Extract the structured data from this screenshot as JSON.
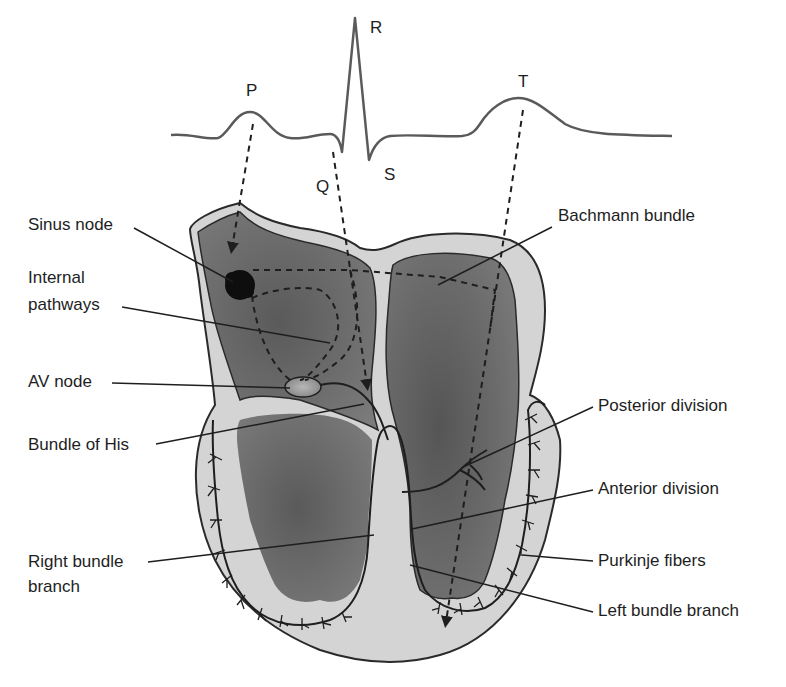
{
  "figure": {
    "ecg_waves": [
      {
        "id": "P",
        "label": "P"
      },
      {
        "id": "Q",
        "label": "Q"
      },
      {
        "id": "R",
        "label": "R"
      },
      {
        "id": "S",
        "label": "S"
      },
      {
        "id": "T",
        "label": "T"
      }
    ],
    "labels": {
      "sinus_node": "Sinus node",
      "internal_pathways_line1": "Internal",
      "internal_pathways_line2": "pathways",
      "av_node": "AV node",
      "bundle_of_his": "Bundle of His",
      "right_bundle_branch_line1": "Right bundle",
      "right_bundle_branch_line2": "branch",
      "bachmann_bundle": "Bachmann bundle",
      "posterior_division": "Posterior division",
      "anterior_division": "Anterior division",
      "purkinje_fibers": "Purkinje fibers",
      "left_bundle_branch": "Left bundle branch"
    },
    "colors": {
      "ink": "#1e1e1e",
      "wall_fill": "#d4d4d4",
      "chamber_fill": "#6e6e6e",
      "chamber_fill_light": "#8a8a8a",
      "background": "#ffffff"
    }
  }
}
